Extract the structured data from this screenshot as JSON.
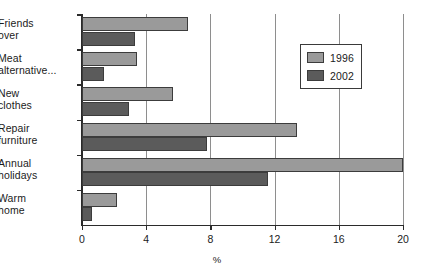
{
  "chart_data": {
    "type": "bar",
    "orientation": "horizontal",
    "title": "",
    "xlabel": "%",
    "ylabel": "",
    "xlim": [
      0,
      20
    ],
    "xticks": [
      0,
      4,
      8,
      12,
      16,
      20
    ],
    "xtick_labels": [
      "0",
      "4",
      "8",
      "12",
      "16",
      "20"
    ],
    "grid": "vertical",
    "legend_position": "top-right",
    "categories": [
      "Friends over",
      "Meat alternative...",
      "New clothes",
      "Repair furniture",
      "Annual holidays",
      "Warm home"
    ],
    "category_lines": [
      [
        "Friends",
        "over"
      ],
      [
        "Meat",
        "alternative..."
      ],
      [
        "New",
        "clothes"
      ],
      [
        "Repair",
        "furniture"
      ],
      [
        "Annual",
        "holidays"
      ],
      [
        "Warm",
        "home"
      ]
    ],
    "series": [
      {
        "name": "1996",
        "color": "#9a9a9a",
        "values": [
          6.6,
          3.4,
          5.7,
          13.4,
          20.0,
          2.2
        ]
      },
      {
        "name": "2002",
        "color": "#5b5b5b",
        "values": [
          3.3,
          1.4,
          2.9,
          7.8,
          11.6,
          0.65
        ]
      }
    ]
  },
  "legend": {
    "entries": [
      {
        "label": "1996",
        "color": "#9a9a9a"
      },
      {
        "label": "2002",
        "color": "#5b5b5b"
      }
    ]
  },
  "axis": {
    "x_title": "%"
  }
}
